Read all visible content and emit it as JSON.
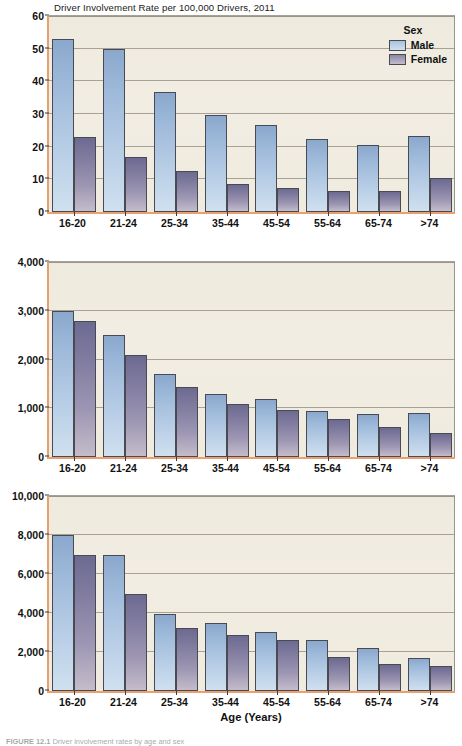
{
  "figure": {
    "caption_label": "FIGURE 12.1",
    "caption_text": "Driver involvement rates by age and sex"
  },
  "legend": {
    "title": "Sex",
    "items": [
      {
        "label": "Male",
        "color": "#b7cde6",
        "key": "male"
      },
      {
        "label": "Female",
        "color": "#9d96b3",
        "key": "female"
      }
    ]
  },
  "axis": {
    "x_title": "Age (Years)",
    "categories": [
      "16-20",
      "21-24",
      "25-34",
      "35-44",
      "45-54",
      "55-64",
      "65-74",
      ">74"
    ]
  },
  "chart_data": [
    {
      "type": "bar",
      "title": "Driver Involvement Rate per 100,000 Drivers, 2011",
      "xlabel": "Age (Years)",
      "ylabel": "Fatal Crashes",
      "ylim": [
        0,
        60
      ],
      "yticks": [
        "0",
        "10",
        "20",
        "30",
        "40",
        "50",
        "60"
      ],
      "ytick_values": [
        0,
        10,
        20,
        30,
        40,
        50,
        60
      ],
      "grid": true,
      "legend_position": "top-right",
      "categories": [
        "16-20",
        "21-24",
        "25-34",
        "35-44",
        "45-54",
        "55-64",
        "65-74",
        ">74"
      ],
      "series": [
        {
          "name": "Male",
          "values": [
            53.0,
            50.0,
            36.8,
            29.8,
            26.6,
            22.5,
            20.6,
            23.3
          ]
        },
        {
          "name": "Female",
          "values": [
            22.9,
            16.8,
            12.6,
            8.6,
            7.4,
            6.4,
            6.3,
            10.3
          ]
        }
      ]
    },
    {
      "type": "bar",
      "title": "",
      "xlabel": "Age (Years)",
      "ylabel": "Injury Crashes",
      "ylim": [
        0,
        4000
      ],
      "yticks": [
        "0",
        "1,000",
        "2,000",
        "3,000",
        "4,000"
      ],
      "ytick_values": [
        0,
        1000,
        2000,
        3000,
        4000
      ],
      "grid": true,
      "legend_position": "none",
      "categories": [
        "16-20",
        "21-24",
        "25-34",
        "35-44",
        "45-54",
        "55-64",
        "65-74",
        ">74"
      ],
      "series": [
        {
          "name": "Male",
          "values": [
            3000,
            2500,
            1700,
            1290,
            1180,
            950,
            880,
            900
          ]
        },
        {
          "name": "Female",
          "values": [
            2800,
            2100,
            1440,
            1080,
            960,
            770,
            610,
            500
          ]
        }
      ]
    },
    {
      "type": "bar",
      "title": "",
      "xlabel": "Age (Years)",
      "ylabel": "Property Damage Only",
      "ylim": [
        0,
        10000
      ],
      "yticks": [
        "0",
        "2,000",
        "4,000",
        "6,000",
        "8,000",
        "10,000"
      ],
      "ytick_values": [
        0,
        2000,
        4000,
        6000,
        8000,
        10000
      ],
      "grid": true,
      "legend_position": "none",
      "categories": [
        "16-20",
        "21-24",
        "25-34",
        "35-44",
        "45-54",
        "55-64",
        "65-74",
        ">74"
      ],
      "series": [
        {
          "name": "Male",
          "values": [
            8000,
            7000,
            3970,
            3470,
            3050,
            2620,
            2210,
            1700
          ]
        },
        {
          "name": "Female",
          "values": [
            7000,
            5000,
            3220,
            2860,
            2630,
            1740,
            1400,
            1280
          ]
        }
      ]
    }
  ]
}
